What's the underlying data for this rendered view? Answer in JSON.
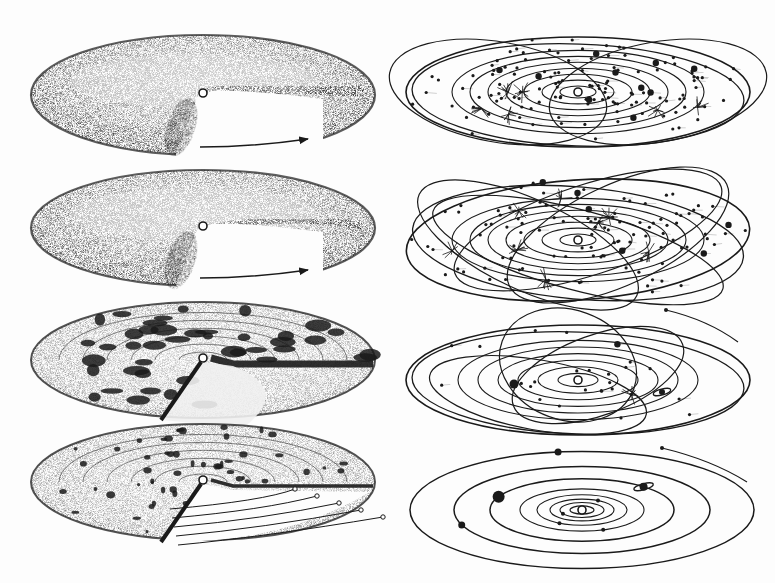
{
  "figure": {
    "ink_color": "#1a1a1a",
    "paper_color": "#fdfdfd",
    "left_column": [
      {
        "id": "nebula-torus-1",
        "stage": "rotating dusty torus with cutaway",
        "has_rotation_arrow": true,
        "cx": 203,
        "cy": 95,
        "rx": 172,
        "ry": 60
      },
      {
        "id": "nebula-torus-2",
        "stage": "flattened torus with cutaway",
        "has_rotation_arrow": true,
        "cx": 203,
        "cy": 228,
        "rx": 172,
        "ry": 58
      },
      {
        "id": "nebula-disk-clumps",
        "stage": "disk with condensing clumps",
        "has_rotation_arrow": false,
        "cx": 203,
        "cy": 360,
        "rx": 172,
        "ry": 58
      },
      {
        "id": "nebula-disk-planetesimals",
        "stage": "disk with planetesimals and orbit trails",
        "has_rotation_arrow": false,
        "cx": 203,
        "cy": 482,
        "rx": 172,
        "ry": 58
      }
    ],
    "right_column": [
      {
        "id": "system-many-bodies",
        "stage": "planar disk with many bodies and crossing orbits",
        "cx": 578,
        "cy": 92,
        "rx": 172,
        "ry": 55
      },
      {
        "id": "system-inclined-orbits",
        "stage": "many inclined intersecting orbits",
        "cx": 578,
        "cy": 240,
        "rx": 172,
        "ry": 60
      },
      {
        "id": "system-clearing",
        "stage": "fewer bodies, some eccentric orbits",
        "cx": 578,
        "cy": 380,
        "rx": 172,
        "ry": 55
      },
      {
        "id": "system-final",
        "stage": "final solar system with concentric planetary orbits",
        "cx": 582,
        "cy": 510,
        "rx": 172,
        "ry": 58
      }
    ],
    "final_system_orbits": [
      12,
      22,
      32,
      45,
      62,
      92,
      128,
      172
    ],
    "final_system_planets": [
      {
        "name": "inner-planet-1",
        "orbit": 2,
        "angle": 210
      },
      {
        "name": "inner-planet-2",
        "orbit": 3,
        "angle": 60
      },
      {
        "name": "inner-planet-3",
        "orbit": 4,
        "angle": 240
      },
      {
        "name": "inner-planet-4",
        "orbit": 5,
        "angle": 290
      },
      {
        "name": "jupiter",
        "orbit": 6,
        "angle": 155
      },
      {
        "name": "saturn",
        "orbit": 6,
        "angle": 48
      },
      {
        "name": "uranus",
        "orbit": 7,
        "angle": 200
      },
      {
        "name": "neptune",
        "orbit": 8,
        "angle": 98
      }
    ]
  }
}
